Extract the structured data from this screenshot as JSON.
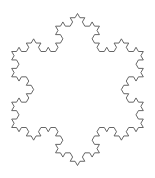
{
  "figure": {
    "type": "koch-snowflake",
    "iterations": 3,
    "stroke_color": "#555555",
    "stroke_width": 0.9,
    "background": "#ffffff",
    "center": [
      77.5,
      89.5
    ],
    "radius": 76,
    "rotation_deg": -90
  }
}
